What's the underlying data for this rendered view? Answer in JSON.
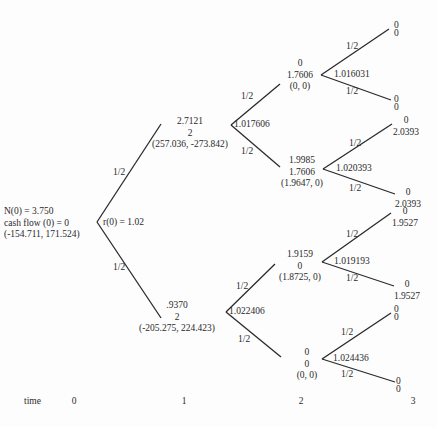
{
  "diagram": {
    "type": "binomial interest rate tree",
    "root": {
      "lines": [
        "N(0) = 3.750",
        "cash flow (0) = 0",
        "(-154.711, 171.524)"
      ],
      "rate": "r(0) = 1.02"
    },
    "t1": {
      "up": {
        "lines": [
          "2.7121",
          "2",
          "(257.036, -273.842)"
        ],
        "rate": "1.017606"
      },
      "down": {
        "lines": [
          ".9370",
          "2",
          "(-205.275, 224.423)"
        ],
        "rate": "1.022406"
      }
    },
    "t2": {
      "uu": {
        "lines": [
          "0",
          "1.7606",
          "(0, 0)"
        ],
        "rate": "1.016031"
      },
      "ud": {
        "lines": [
          "1.9985",
          "1.7606",
          "(1.9647, 0)"
        ],
        "rate": "1.020393"
      },
      "du": {
        "lines": [
          "1.9159",
          "0",
          "(1.8725, 0)"
        ],
        "rate": "1.019193"
      },
      "dd": {
        "lines": [
          "0",
          "0",
          "(0, 0)"
        ],
        "rate": "1.024436"
      }
    },
    "t3": [
      {
        "lines": [
          "0",
          "0"
        ]
      },
      {
        "lines": [
          "0",
          "0"
        ]
      },
      {
        "lines": [
          "0",
          "2.0393"
        ]
      },
      {
        "lines": [
          "0",
          "2.0393"
        ]
      },
      {
        "lines": [
          "0",
          "1.9527"
        ]
      },
      {
        "lines": [
          "0",
          "1.9527"
        ]
      },
      {
        "lines": [
          "0",
          "0"
        ]
      },
      {
        "lines": [
          "0",
          "0"
        ]
      }
    ],
    "probability": "1/2",
    "timeline": {
      "label": "time",
      "ticks": [
        "0",
        "1",
        "2",
        "3"
      ]
    }
  }
}
